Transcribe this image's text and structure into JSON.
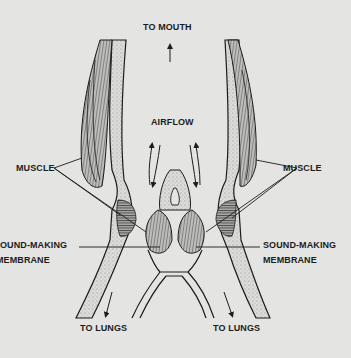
{
  "diagram": {
    "colors": {
      "background": "#e4e4e2",
      "ink": "#1c1c1c",
      "stipple": "#8a8a88"
    },
    "labels": {
      "to_mouth": "TO MOUTH",
      "airflow": "AIRFLOW",
      "muscle_left": "MUSCLE",
      "muscle_right": "MUSCLE",
      "membrane_left_line1": "OUND-MAKING",
      "membrane_left_line2": "MEMBRANE",
      "membrane_right_line1": "SOUND-MAKING",
      "membrane_right_line2": "MEMBRANE",
      "to_lungs_left": "TO LUNGS",
      "to_lungs_right": "TO LUNGS"
    }
  }
}
